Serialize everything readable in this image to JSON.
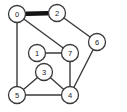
{
  "diagram": {
    "background_color": "#ffffff",
    "node_fill_color": "#ffffff",
    "node_stroke_color": "#3a3a3a",
    "edge_color": "#3a3a3a",
    "highlight_edge_color": "#141414",
    "node_radius": 8.5,
    "width": 127,
    "height": 112
  },
  "nodes": [
    {
      "id": "0",
      "label": "0",
      "x": 17,
      "y": 14
    },
    {
      "id": "1",
      "label": "1",
      "x": 37,
      "y": 53
    },
    {
      "id": "2",
      "label": "2",
      "x": 57,
      "y": 13
    },
    {
      "id": "3",
      "label": "3",
      "x": 44,
      "y": 72
    },
    {
      "id": "4",
      "label": "4",
      "x": 70,
      "y": 95
    },
    {
      "id": "5",
      "label": "5",
      "x": 17,
      "y": 95
    },
    {
      "id": "6",
      "label": "6",
      "x": 97,
      "y": 42
    },
    {
      "id": "7",
      "label": "7",
      "x": 70,
      "y": 53
    }
  ],
  "edges": [
    {
      "id": "e-0-2",
      "source": "0",
      "target": "2",
      "x1": 17,
      "y1": 14,
      "x2": 57,
      "y2": 13,
      "highlight": true
    },
    {
      "id": "e-0-7",
      "source": "0",
      "target": "7",
      "x1": 17,
      "y1": 14,
      "x2": 70,
      "y2": 53,
      "highlight": false
    },
    {
      "id": "e-0-5",
      "source": "0",
      "target": "5",
      "x1": 17,
      "y1": 14,
      "x2": 17,
      "y2": 95,
      "highlight": false
    },
    {
      "id": "e-2-6",
      "source": "2",
      "target": "6",
      "x1": 57,
      "y1": 13,
      "x2": 97,
      "y2": 42,
      "highlight": false
    },
    {
      "id": "e-6-4",
      "source": "6",
      "target": "4",
      "x1": 97,
      "y1": 42,
      "x2": 70,
      "y2": 95,
      "highlight": false
    },
    {
      "id": "e-1-7",
      "source": "1",
      "target": "7",
      "x1": 37,
      "y1": 53,
      "x2": 70,
      "y2": 53,
      "highlight": false
    },
    {
      "id": "e-7-4",
      "source": "7",
      "target": "4",
      "x1": 70,
      "y1": 53,
      "x2": 70,
      "y2": 95,
      "highlight": false
    },
    {
      "id": "e-3-5",
      "source": "3",
      "target": "5",
      "x1": 44,
      "y1": 72,
      "x2": 17,
      "y2": 95,
      "highlight": false
    },
    {
      "id": "e-3-4",
      "source": "3",
      "target": "4",
      "x1": 44,
      "y1": 72,
      "x2": 70,
      "y2": 95,
      "highlight": false
    },
    {
      "id": "e-5-4",
      "source": "5",
      "target": "4",
      "x1": 17,
      "y1": 95,
      "x2": 70,
      "y2": 95,
      "highlight": false
    }
  ]
}
